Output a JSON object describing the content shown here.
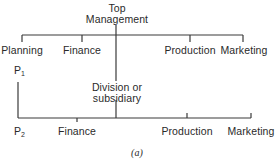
{
  "diagram": {
    "top_node": {
      "line1": "Top",
      "line2": "Management"
    },
    "top_row": [
      {
        "label": "Planning"
      },
      {
        "label": "Finance"
      },
      {
        "label": "Production"
      },
      {
        "label": "Marketing"
      }
    ],
    "p1": {
      "letter": "P",
      "sub": "1"
    },
    "division": {
      "line1": "Division or",
      "line2": "subsidiary"
    },
    "bottom_row": [
      {
        "letter": "P",
        "sub": "2"
      },
      {
        "label": "Finance"
      },
      {
        "label": "Production"
      },
      {
        "label": "Marketing"
      }
    ],
    "caption": "(a)",
    "line_color": "#3a3a3a"
  }
}
